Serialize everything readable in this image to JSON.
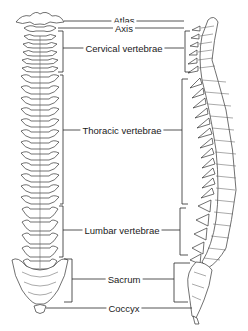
{
  "diagram": {
    "views": {
      "left": "anterior-view-spine",
      "right": "lateral-view-spine"
    },
    "labels": {
      "atlas": "Atlas",
      "axis": "Axis",
      "cervical": "Cervical vertebrae",
      "thoracic": "Thoracic vertebrae",
      "lumbar": "Lumbar vertebrae",
      "sacrum": "Sacrum",
      "coccyx": "Coccyx"
    },
    "colors": {
      "line": "#2a2a2a",
      "text": "#1a1a1a",
      "background": "#ffffff"
    }
  }
}
